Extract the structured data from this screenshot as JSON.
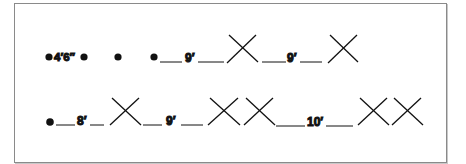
{
  "figure": {
    "border_color": "#8a8a8a",
    "ink_color": "#111111",
    "rows": [
      {
        "id": "row-1",
        "labels": [
          "4′6″",
          "9′",
          "9′"
        ],
        "sequence": [
          "dot",
          "label:4′6″",
          "dot",
          "dot",
          "dot",
          "line",
          "label:9′",
          "line",
          "x",
          "line",
          "label:9′",
          "line",
          "x"
        ]
      },
      {
        "id": "row-2",
        "labels": [
          "8′",
          "9′",
          "10′"
        ],
        "sequence": [
          "dot",
          "line",
          "label:8′",
          "line",
          "x",
          "line",
          "label:9′",
          "line",
          "x",
          "x",
          "line",
          "label:10′",
          "line",
          "x",
          "x"
        ]
      }
    ]
  }
}
